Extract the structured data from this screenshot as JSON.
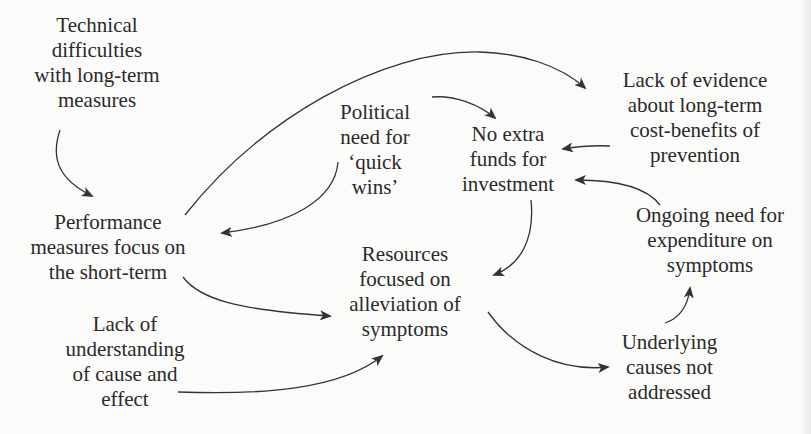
{
  "diagram": {
    "type": "causal-loop",
    "nodes": [
      {
        "id": "technical",
        "label": "Technical\ndifficulties\nwith long-term\nmeasures"
      },
      {
        "id": "political",
        "label": "Political\nneed for\n‘quick\nwins’"
      },
      {
        "id": "nofunds",
        "label": "No extra\nfunds for\ninvestment"
      },
      {
        "id": "lackevidence",
        "label": "Lack of evidence\nabout long-term\ncost-benefits of\nprevention"
      },
      {
        "id": "performance",
        "label": "Performance\nmeasures focus on\nthe short-term"
      },
      {
        "id": "ongoing",
        "label": "Ongoing need for\nexpenditure on\nsymptoms"
      },
      {
        "id": "resources",
        "label": "Resources\nfocused on\nalleviation of\nsymptoms"
      },
      {
        "id": "lackunderstanding",
        "label": "Lack of\nunderstanding\nof cause and\neffect"
      },
      {
        "id": "underlying",
        "label": "Underlying\ncauses not\naddressed"
      }
    ],
    "edges": [
      {
        "from": "technical",
        "to": "performance"
      },
      {
        "from": "performance",
        "to": "lackevidence"
      },
      {
        "from": "political",
        "to": "nofunds"
      },
      {
        "from": "political",
        "to": "performance"
      },
      {
        "from": "lackevidence",
        "to": "nofunds"
      },
      {
        "from": "ongoing",
        "to": "nofunds"
      },
      {
        "from": "nofunds",
        "to": "resources"
      },
      {
        "from": "performance",
        "to": "resources"
      },
      {
        "from": "lackunderstanding",
        "to": "resources"
      },
      {
        "from": "resources",
        "to": "underlying"
      },
      {
        "from": "underlying",
        "to": "ongoing"
      }
    ]
  },
  "colors": {
    "background": "#fbfbfa",
    "text": "#2a2a2a",
    "arrow": "#333333"
  }
}
